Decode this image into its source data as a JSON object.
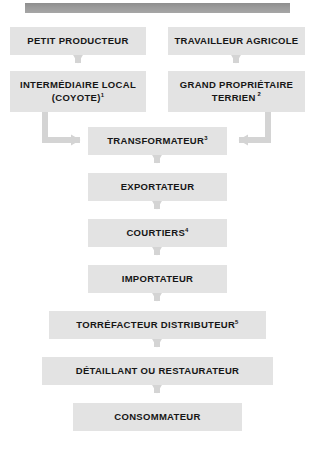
{
  "header": {
    "bar_present": true,
    "bar_color": "#9b9b9b"
  },
  "theme": {
    "node_fill": "#e3e3e3",
    "node_text": "#161616",
    "connector": "#d4d4d4",
    "page_background": "#ffffff"
  },
  "diagram": {
    "title": "",
    "type": "flowchart",
    "orientation": "top-to-bottom",
    "nodes": [
      {
        "id": "petit-producteur",
        "label": "PETIT PRODUCTEUR",
        "note": "",
        "row": 1,
        "column": "left"
      },
      {
        "id": "travailleur-agricole",
        "label": "TRAVAILLEUR AGRICOLE",
        "note": "",
        "row": 1,
        "column": "right"
      },
      {
        "id": "intermediaire-local",
        "label_line1": "INTERMÉDIAIRE LOCAL",
        "label_line2": "(COYOTE)",
        "note": "1",
        "row": 2,
        "column": "left"
      },
      {
        "id": "grand-proprietaire",
        "label_line1": "GRAND PROPRIÉTAIRE",
        "label_line2": "TERRIEN",
        "note": "2",
        "row": 2,
        "column": "right"
      },
      {
        "id": "transformateur",
        "label": "TRANSFORMATEUR",
        "note": "3",
        "row": 3,
        "column": "center"
      },
      {
        "id": "exportateur",
        "label": "EXPORTATEUR",
        "note": "",
        "row": 4,
        "column": "center"
      },
      {
        "id": "courtiers",
        "label": "COURTIERS",
        "note": "4",
        "row": 5,
        "column": "center"
      },
      {
        "id": "importateur",
        "label": "IMPORTATEUR",
        "note": "",
        "row": 6,
        "column": "center"
      },
      {
        "id": "torrefacteur",
        "label": "TORRÉFACTEUR DISTRIBUTEUR",
        "note": "5",
        "row": 7,
        "column": "center"
      },
      {
        "id": "detaillant",
        "label": "DÉTAILLANT OU RESTAURATEUR",
        "note": "",
        "row": 8,
        "column": "center"
      },
      {
        "id": "consommateur",
        "label": "CONSOMMATEUR",
        "note": "",
        "row": 9,
        "column": "center"
      }
    ],
    "edges": [
      {
        "from": "petit-producteur",
        "to": "intermediaire-local",
        "style": "straight-down"
      },
      {
        "from": "travailleur-agricole",
        "to": "grand-proprietaire",
        "style": "straight-down"
      },
      {
        "from": "intermediaire-local",
        "to": "transformateur",
        "style": "elbow-right"
      },
      {
        "from": "grand-proprietaire",
        "to": "transformateur",
        "style": "elbow-left"
      },
      {
        "from": "transformateur",
        "to": "exportateur",
        "style": "straight-down"
      },
      {
        "from": "exportateur",
        "to": "courtiers",
        "style": "straight-down"
      },
      {
        "from": "courtiers",
        "to": "importateur",
        "style": "straight-down"
      },
      {
        "from": "importateur",
        "to": "torrefacteur",
        "style": "straight-down"
      },
      {
        "from": "torrefacteur",
        "to": "detaillant",
        "style": "straight-down"
      },
      {
        "from": "detaillant",
        "to": "consommateur",
        "style": "straight-down"
      }
    ]
  }
}
